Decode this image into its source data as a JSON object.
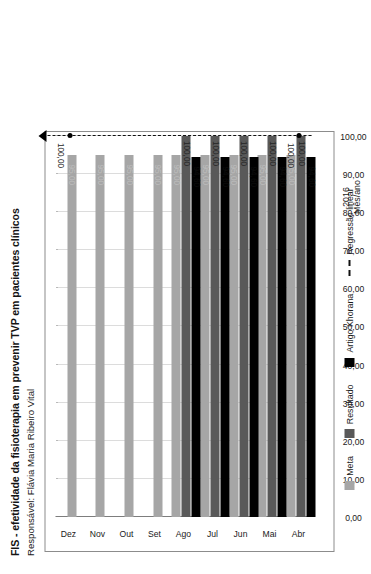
{
  "header": {
    "title": "FIS - efetividade da fisioterapia em prevenir TVP em pacientes clínicos",
    "subtitle": "Responsável: Flávia Maria Ribeiro Vital"
  },
  "legend": {
    "items": [
      {
        "label": "Meta",
        "color": "#a6a6a6",
        "icon": "square-swatch"
      },
      {
        "label": "Resultado",
        "color": "#595959",
        "icon": "square-swatch"
      },
      {
        "label": "Artigo Khorana",
        "color": "#000000",
        "icon": "square-swatch"
      },
      {
        "label": "Regressão linear",
        "color": "#111111",
        "icon": "dashed-line-swatch"
      }
    ]
  },
  "axis": {
    "category_title_line1": "2016",
    "category_title_line2": "Mês/ano",
    "value_ticks": [
      "100,00",
      "90,00",
      "80,00",
      "70,00",
      "60,00",
      "50,00",
      "40,00",
      "30,00",
      "20,00",
      "10,00",
      "0,00"
    ]
  },
  "chart_data": {
    "type": "bar",
    "orientation": "horizontal-rotated",
    "title": "FIS - efetividade da fisioterapia em prevenir TVP em pacientes clínicos",
    "subtitle": "Responsável: Flávia Maria Ribeiro Vital",
    "xlabel": "Mês/ano",
    "ylabel": "",
    "ylim": [
      0,
      100
    ],
    "grid": true,
    "legend_position": "bottom",
    "categories": [
      "Abr",
      "Mai",
      "Jun",
      "Jul",
      "Ago",
      "Set",
      "Out",
      "Nov",
      "Dez"
    ],
    "series": [
      {
        "name": "Meta",
        "color": "#a6a6a6",
        "values": [
          95.0,
          95.0,
          95.0,
          95.0,
          95.0,
          95.0,
          95.0,
          95.0,
          95.0
        ],
        "labels": [
          "95,00",
          "95,00",
          "95,00",
          "95,00",
          "95,00",
          "95,00",
          "95,00",
          "95,00",
          "95,00"
        ]
      },
      {
        "name": "Resultado",
        "color": "#595959",
        "values": [
          100.0,
          100.0,
          100.0,
          100.0,
          100.0,
          null,
          null,
          null,
          null
        ],
        "labels": [
          "100,00",
          "100,00",
          "100,00",
          "100,00",
          "100,00",
          "",
          "",
          "",
          ""
        ]
      },
      {
        "name": "Artigo Khorana",
        "color": "#000000",
        "values": [
          94.6,
          94.6,
          94.6,
          94.6,
          94.6,
          null,
          null,
          null,
          null
        ],
        "labels": [
          "94,60",
          "94,60",
          "94,60",
          "94,60",
          "94,60",
          "",
          "",
          "",
          ""
        ]
      }
    ],
    "trendline": {
      "name": "Regressão linear",
      "style": "dashed",
      "color": "#111111",
      "value": 100.0,
      "endpoint_labels": [
        "100,00",
        "100,00"
      ],
      "markers": [
        "Abr",
        "Dez"
      ]
    }
  }
}
